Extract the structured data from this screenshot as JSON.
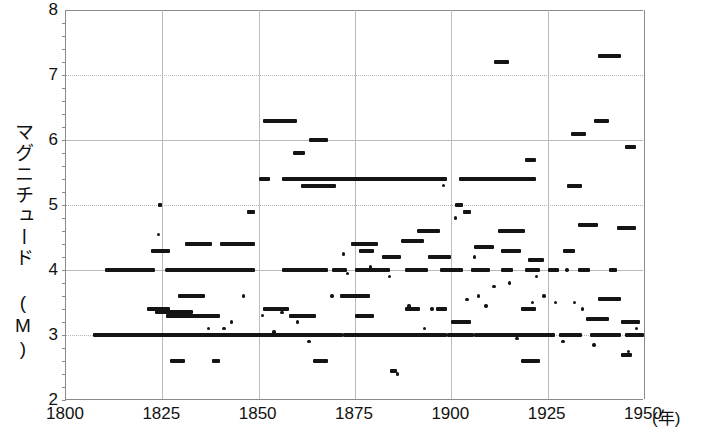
{
  "chart_data": {
    "type": "scatter",
    "title": "",
    "xlabel": "(年)",
    "ylabel": "マグニチュード (M)",
    "xlim": [
      1800,
      1950
    ],
    "ylim": [
      2,
      8
    ],
    "xticks": [
      1800,
      1825,
      1850,
      1875,
      1900,
      1925,
      1950
    ],
    "yticks": [
      2,
      3,
      4,
      5,
      6,
      7,
      8
    ],
    "grid": "major solid at even y and 25-year x, dotted at odd y",
    "legend": null,
    "note": "Each datum is a horizontal bar: a magnitude value (y) spanning a year range (x). Short bars/dots are single events.",
    "segments": [
      {
        "y": 3.0,
        "x0": 1807,
        "x1": 1872
      },
      {
        "y": 3.0,
        "x0": 1872,
        "x1": 1899
      },
      {
        "y": 3.0,
        "x0": 1899,
        "x1": 1906
      },
      {
        "y": 3.0,
        "x0": 1906,
        "x1": 1927
      },
      {
        "y": 3.0,
        "x0": 1928,
        "x1": 1934
      },
      {
        "y": 3.0,
        "x0": 1936,
        "x1": 1944
      },
      {
        "y": 3.0,
        "x0": 1945,
        "x1": 1950
      },
      {
        "y": 4.0,
        "x0": 1810,
        "x1": 1823
      },
      {
        "y": 4.0,
        "x0": 1826,
        "x1": 1849
      },
      {
        "y": 4.0,
        "x0": 1856,
        "x1": 1868
      },
      {
        "y": 4.0,
        "x0": 1869,
        "x1": 1873
      },
      {
        "y": 4.0,
        "x0": 1875,
        "x1": 1884
      },
      {
        "y": 4.0,
        "x0": 1888,
        "x1": 1894
      },
      {
        "y": 4.0,
        "x0": 1897,
        "x1": 1903
      },
      {
        "y": 4.0,
        "x0": 1905,
        "x1": 1910
      },
      {
        "y": 4.0,
        "x0": 1913,
        "x1": 1916
      },
      {
        "y": 4.0,
        "x0": 1919,
        "x1": 1923
      },
      {
        "y": 4.0,
        "x0": 1925,
        "x1": 1928
      },
      {
        "y": 4.0,
        "x0": 1933,
        "x1": 1936
      },
      {
        "y": 4.0,
        "x0": 1941,
        "x1": 1943
      },
      {
        "y": 5.4,
        "x0": 1850,
        "x1": 1853
      },
      {
        "y": 5.4,
        "x0": 1856,
        "x1": 1899
      },
      {
        "y": 5.4,
        "x0": 1902,
        "x1": 1922
      },
      {
        "y": 5.3,
        "x0": 1861,
        "x1": 1870
      },
      {
        "y": 5.3,
        "x0": 1930,
        "x1": 1934
      },
      {
        "y": 6.3,
        "x0": 1851,
        "x1": 1860
      },
      {
        "y": 6.3,
        "x0": 1937,
        "x1": 1941
      },
      {
        "y": 6.0,
        "x0": 1863,
        "x1": 1868
      },
      {
        "y": 5.8,
        "x0": 1859,
        "x1": 1862
      },
      {
        "y": 6.1,
        "x0": 1931,
        "x1": 1935
      },
      {
        "y": 5.9,
        "x0": 1945,
        "x1": 1948
      },
      {
        "y": 7.2,
        "x0": 1911,
        "x1": 1915
      },
      {
        "y": 7.3,
        "x0": 1938,
        "x1": 1944
      },
      {
        "y": 5.7,
        "x0": 1919,
        "x1": 1922
      },
      {
        "y": 5.0,
        "x0": 1824,
        "x1": 1825
      },
      {
        "y": 4.9,
        "x0": 1847,
        "x1": 1849
      },
      {
        "y": 4.9,
        "x0": 1903,
        "x1": 1905
      },
      {
        "y": 5.0,
        "x0": 1901,
        "x1": 1903
      },
      {
        "y": 4.6,
        "x0": 1891,
        "x1": 1897
      },
      {
        "y": 4.6,
        "x0": 1912,
        "x1": 1919
      },
      {
        "y": 4.65,
        "x0": 1943,
        "x1": 1948
      },
      {
        "y": 4.7,
        "x0": 1933,
        "x1": 1938
      },
      {
        "y": 4.4,
        "x0": 1831,
        "x1": 1838
      },
      {
        "y": 4.4,
        "x0": 1840,
        "x1": 1849
      },
      {
        "y": 4.4,
        "x0": 1874,
        "x1": 1881
      },
      {
        "y": 4.45,
        "x0": 1887,
        "x1": 1893
      },
      {
        "y": 4.35,
        "x0": 1906,
        "x1": 1911
      },
      {
        "y": 4.3,
        "x0": 1822,
        "x1": 1827
      },
      {
        "y": 4.3,
        "x0": 1876,
        "x1": 1880
      },
      {
        "y": 4.3,
        "x0": 1913,
        "x1": 1918
      },
      {
        "y": 4.3,
        "x0": 1929,
        "x1": 1932
      },
      {
        "y": 4.2,
        "x0": 1882,
        "x1": 1887
      },
      {
        "y": 4.2,
        "x0": 1894,
        "x1": 1900
      },
      {
        "y": 4.15,
        "x0": 1920,
        "x1": 1924
      },
      {
        "y": 3.6,
        "x0": 1829,
        "x1": 1836
      },
      {
        "y": 3.6,
        "x0": 1871,
        "x1": 1879
      },
      {
        "y": 3.55,
        "x0": 1938,
        "x1": 1944
      },
      {
        "y": 3.4,
        "x0": 1821,
        "x1": 1827
      },
      {
        "y": 3.4,
        "x0": 1851,
        "x1": 1858
      },
      {
        "y": 3.4,
        "x0": 1888,
        "x1": 1892
      },
      {
        "y": 3.4,
        "x0": 1896,
        "x1": 1899
      },
      {
        "y": 3.4,
        "x0": 1918,
        "x1": 1922
      },
      {
        "y": 3.35,
        "x0": 1823,
        "x1": 1833
      },
      {
        "y": 3.3,
        "x0": 1826,
        "x1": 1840
      },
      {
        "y": 3.3,
        "x0": 1858,
        "x1": 1865
      },
      {
        "y": 3.3,
        "x0": 1875,
        "x1": 1880
      },
      {
        "y": 3.25,
        "x0": 1935,
        "x1": 1941
      },
      {
        "y": 3.2,
        "x0": 1900,
        "x1": 1905
      },
      {
        "y": 3.2,
        "x0": 1944,
        "x1": 1949
      },
      {
        "y": 2.6,
        "x0": 1827,
        "x1": 1831
      },
      {
        "y": 2.6,
        "x0": 1838,
        "x1": 1840
      },
      {
        "y": 2.6,
        "x0": 1864,
        "x1": 1868
      },
      {
        "y": 2.6,
        "x0": 1918,
        "x1": 1923
      },
      {
        "y": 2.7,
        "x0": 1944,
        "x1": 1947
      },
      {
        "y": 2.45,
        "x0": 1884,
        "x1": 1886
      }
    ],
    "points": [
      {
        "x": 1824,
        "y": 4.55
      },
      {
        "x": 1826,
        "y": 4.0
      },
      {
        "x": 1837,
        "y": 3.1
      },
      {
        "x": 1843,
        "y": 3.2
      },
      {
        "x": 1846,
        "y": 3.6
      },
      {
        "x": 1851,
        "y": 3.3
      },
      {
        "x": 1854,
        "y": 3.05
      },
      {
        "x": 1856,
        "y": 3.35
      },
      {
        "x": 1860,
        "y": 3.2
      },
      {
        "x": 1863,
        "y": 2.9
      },
      {
        "x": 1869,
        "y": 3.6
      },
      {
        "x": 1873,
        "y": 3.95
      },
      {
        "x": 1877,
        "y": 3.6
      },
      {
        "x": 1879,
        "y": 4.05
      },
      {
        "x": 1884,
        "y": 3.9
      },
      {
        "x": 1886,
        "y": 2.4
      },
      {
        "x": 1889,
        "y": 3.45
      },
      {
        "x": 1893,
        "y": 3.1
      },
      {
        "x": 1895,
        "y": 3.4
      },
      {
        "x": 1898,
        "y": 5.3
      },
      {
        "x": 1901,
        "y": 4.8
      },
      {
        "x": 1904,
        "y": 3.55
      },
      {
        "x": 1907,
        "y": 3.6
      },
      {
        "x": 1909,
        "y": 3.45
      },
      {
        "x": 1911,
        "y": 3.75
      },
      {
        "x": 1915,
        "y": 3.8
      },
      {
        "x": 1917,
        "y": 2.95
      },
      {
        "x": 1921,
        "y": 3.5
      },
      {
        "x": 1924,
        "y": 3.6
      },
      {
        "x": 1927,
        "y": 3.5
      },
      {
        "x": 1929,
        "y": 2.9
      },
      {
        "x": 1932,
        "y": 3.5
      },
      {
        "x": 1934,
        "y": 3.4
      },
      {
        "x": 1937,
        "y": 2.85
      },
      {
        "x": 1940,
        "y": 3.0
      },
      {
        "x": 1942,
        "y": 4.0
      },
      {
        "x": 1946,
        "y": 2.75
      },
      {
        "x": 1948,
        "y": 3.1
      },
      {
        "x": 1833,
        "y": 4.0
      },
      {
        "x": 1841,
        "y": 3.1
      },
      {
        "x": 1872,
        "y": 4.25
      },
      {
        "x": 1906,
        "y": 4.2
      },
      {
        "x": 1922,
        "y": 3.9
      },
      {
        "x": 1930,
        "y": 4.0
      }
    ]
  }
}
